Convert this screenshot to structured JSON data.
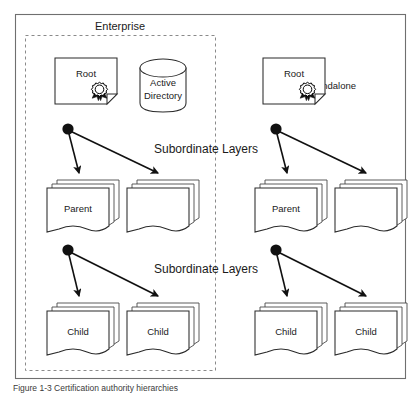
{
  "figure": {
    "caption": "Figure 1-3   Certification authority hierarchies",
    "outer_frame": "diagram-border"
  },
  "groups": {
    "enterprise": {
      "label": "Enterprise",
      "boundary": "dashed"
    },
    "standalone": {
      "label": "Standalone",
      "boundary": "none"
    }
  },
  "layer_labels": [
    {
      "id": "upper",
      "text": "Subordinate Layers"
    },
    {
      "id": "lower",
      "text": "Subordinate Layers"
    }
  ],
  "nodes": {
    "enterprise": {
      "root": {
        "label": "Root",
        "icon": "certificate-document-icon"
      },
      "directory": {
        "label_line1": "Active",
        "label_line2": "Directory",
        "icon": "database-cylinder-icon"
      },
      "parents": [
        {
          "label": "Parent",
          "icon": "document-stack-icon"
        },
        {
          "label": "",
          "icon": "document-stack-icon"
        }
      ],
      "children": [
        {
          "label": "Child",
          "icon": "document-stack-icon"
        },
        {
          "label": "Child",
          "icon": "document-stack-icon"
        }
      ]
    },
    "standalone": {
      "root": {
        "label": "Root",
        "icon": "certificate-document-icon"
      },
      "parents": [
        {
          "label": "Parent",
          "icon": "document-stack-icon"
        },
        {
          "label": "",
          "icon": "document-stack-icon"
        }
      ],
      "children": [
        {
          "label": "Child",
          "icon": "document-stack-icon"
        },
        {
          "label": "Child",
          "icon": "document-stack-icon"
        }
      ]
    }
  },
  "colors": {
    "frame": "#6f6f6f",
    "dashed_boundary": "#8a8a8a",
    "shape_outline": "#2b2b2b",
    "arrow": "#111111",
    "text": "#1a1a1a",
    "background": "#ffffff"
  }
}
